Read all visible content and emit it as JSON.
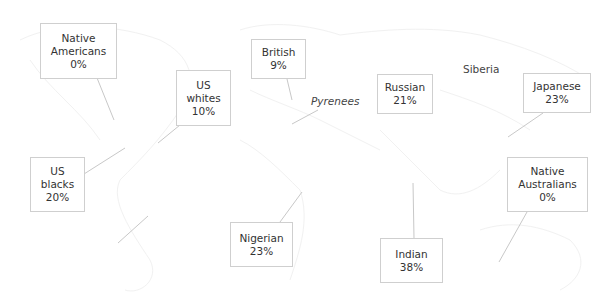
{
  "diagram": {
    "type": "world map annotation",
    "labels": [
      {
        "id": "native-americans",
        "lines": [
          "Native",
          "Americans",
          "0%"
        ],
        "group": "Native Americans",
        "value": "0%"
      },
      {
        "id": "us-whites",
        "lines": [
          "US",
          "whites",
          "10%"
        ],
        "group": "US whites",
        "value": "10%"
      },
      {
        "id": "british",
        "lines": [
          "British",
          "9%"
        ],
        "group": "British",
        "value": "9%"
      },
      {
        "id": "russian",
        "lines": [
          "Russian",
          "21%"
        ],
        "group": "Russian",
        "value": "21%"
      },
      {
        "id": "japanese",
        "lines": [
          "Japanese",
          "23%"
        ],
        "group": "Japanese",
        "value": "23%"
      },
      {
        "id": "us-blacks",
        "lines": [
          "US",
          "blacks",
          "20%"
        ],
        "group": "US blacks",
        "value": "20%"
      },
      {
        "id": "nigerian",
        "lines": [
          "Nigerian",
          "23%"
        ],
        "group": "Nigerian",
        "value": "23%"
      },
      {
        "id": "indian",
        "lines": [
          "Indian",
          "38%"
        ],
        "group": "Indian",
        "value": "38%"
      },
      {
        "id": "native-australians",
        "lines": [
          "Native",
          "Australians",
          "0%"
        ],
        "group": "Native Australians",
        "value": "0%"
      }
    ],
    "places": {
      "pyrenees": "Pyrenees",
      "siberia": "Siberia"
    },
    "colors": {
      "box_border": "#cfcfcf",
      "leader_line": "#c8c8c8",
      "text": "#333333",
      "map_outline": "#f2f2f2"
    }
  }
}
